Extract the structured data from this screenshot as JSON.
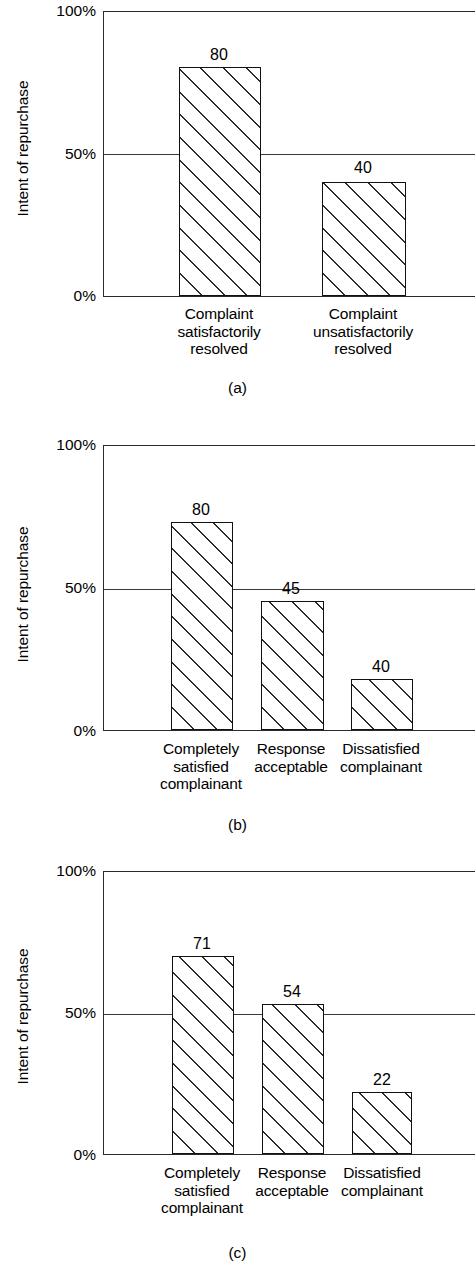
{
  "figure": {
    "background": "#ffffff",
    "line_color": "#2b2b2b",
    "bar_outline": "#111111",
    "hatch_color": "#2c2c2c"
  },
  "chart_data": [
    {
      "type": "bar",
      "panel": "a",
      "caption": "(a)",
      "title": "",
      "xlabel": "",
      "ylabel": "Intent of repurchase",
      "ylim": [
        0,
        100
      ],
      "yticks": [
        "0%",
        "50%",
        "100%"
      ],
      "ytick_values": [
        0,
        50,
        100
      ],
      "grid": "50% reference line only",
      "legend": "none",
      "categories": [
        "Complaint\nsatisfactorily\nresolved",
        "Complaint\nunsatisfactorily\nresolved"
      ],
      "values": [
        80,
        40
      ],
      "bar_labels": [
        "80",
        "40"
      ],
      "plotted_heights_pct": [
        80,
        40
      ]
    },
    {
      "type": "bar",
      "panel": "b",
      "caption": "(b)",
      "title": "",
      "xlabel": "",
      "ylabel": "Intent of repurchase",
      "ylim": [
        0,
        100
      ],
      "yticks": [
        "0%",
        "50%",
        "100%"
      ],
      "ytick_values": [
        0,
        50,
        100
      ],
      "grid": "50% reference line only",
      "legend": "none",
      "categories": [
        "Completely\nsatisfied\ncomplainant",
        "Response\nacceptable",
        "Dissatisfied\ncomplainant"
      ],
      "values": [
        80,
        45,
        40
      ],
      "bar_labels": [
        "80",
        "45",
        "40"
      ],
      "plotted_heights_pct": [
        72.7,
        45.1,
        17.8
      ]
    },
    {
      "type": "bar",
      "panel": "c",
      "caption": "(c)",
      "title": "",
      "xlabel": "",
      "ylabel": "Intent of repurchase",
      "ylim": [
        0,
        100
      ],
      "yticks": [
        "0%",
        "50%",
        "100%"
      ],
      "ytick_values": [
        0,
        50,
        100
      ],
      "grid": "50% reference line only",
      "legend": "none",
      "categories": [
        "Completely\nsatisfied\ncomplainant",
        "Response\nacceptable",
        "Dissatisfied\ncomplainant"
      ],
      "values": [
        71,
        54,
        22
      ],
      "bar_labels": [
        "71",
        "54",
        "22"
      ],
      "plotted_heights_pct": [
        69.7,
        52.8,
        21.8
      ]
    }
  ],
  "panels": [
    {
      "id": "a",
      "caption": "(a)",
      "ylabel": "Intent of repurchase",
      "ticks": {
        "top": "100%",
        "mid": "50%",
        "bottom": "0%"
      },
      "bars": [
        {
          "label": "80",
          "cat": "Complaint\nsatisfactorily\nresolved"
        },
        {
          "label": "40",
          "cat": "Complaint\nunsatisfactorily\nresolved"
        }
      ]
    },
    {
      "id": "b",
      "caption": "(b)",
      "ylabel": "Intent of repurchase",
      "ticks": {
        "top": "100%",
        "mid": "50%",
        "bottom": "0%"
      },
      "bars": [
        {
          "label": "80",
          "cat": "Completely\nsatisfied\ncomplainant"
        },
        {
          "label": "45",
          "cat": "Response\nacceptable"
        },
        {
          "label": "40",
          "cat": "Dissatisfied\ncomplainant"
        }
      ]
    },
    {
      "id": "c",
      "caption": "(c)",
      "ylabel": "Intent of repurchase",
      "ticks": {
        "top": "100%",
        "mid": "50%",
        "bottom": "0%"
      },
      "bars": [
        {
          "label": "71",
          "cat": "Completely\nsatisfied\ncomplainant"
        },
        {
          "label": "54",
          "cat": "Response\nacceptable"
        },
        {
          "label": "22",
          "cat": "Dissatisfied\ncomplainant"
        }
      ]
    }
  ]
}
